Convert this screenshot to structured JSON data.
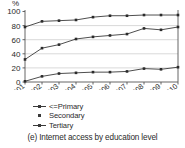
{
  "caption": "(e) Internet access by education level",
  "axis": {
    "y_unit_label": "%",
    "y_ticks": [
      "0",
      "20",
      "40",
      "60",
      "80",
      "100"
    ],
    "x_ticks": [
      "2001",
      "2002",
      "2003",
      "2004",
      "2005",
      "2006",
      "2007",
      "2008",
      "2009",
      "2010"
    ]
  },
  "legend": {
    "items": [
      {
        "label": "<=Primary",
        "marker": "line-square-marker"
      },
      {
        "label": "Secondary",
        "marker": "square-marker"
      },
      {
        "label": "Tertiary",
        "marker": "line-square-marker"
      }
    ]
  },
  "colors": {
    "series_line": "#3a3a3a",
    "marker": "#2b2b2b",
    "grid": "#c8c8c8",
    "axis": "#555555",
    "background": "#ffffff",
    "text": "#2b2b2b"
  },
  "chart_data": {
    "type": "line",
    "title": "(e) Internet access by education level",
    "xlabel": "",
    "ylabel": "%",
    "categories": [
      "2001",
      "2002",
      "2003",
      "2004",
      "2005",
      "2006",
      "2007",
      "2008",
      "2009",
      "2010"
    ],
    "ylim": [
      0,
      100
    ],
    "ytick_step": 20,
    "grid": "horizontal",
    "legend_position": "below-axis-left",
    "series": [
      {
        "name": "<=Primary",
        "values": [
          1,
          8,
          12,
          13,
          14,
          14,
          15,
          19,
          18,
          21
        ]
      },
      {
        "name": "Secondary",
        "values": [
          32,
          48,
          53,
          61,
          64,
          66,
          68,
          76,
          74,
          78
        ]
      },
      {
        "name": "Tertiary",
        "values": [
          78,
          86,
          87,
          88,
          92,
          94,
          94,
          95,
          95,
          95
        ]
      }
    ]
  }
}
